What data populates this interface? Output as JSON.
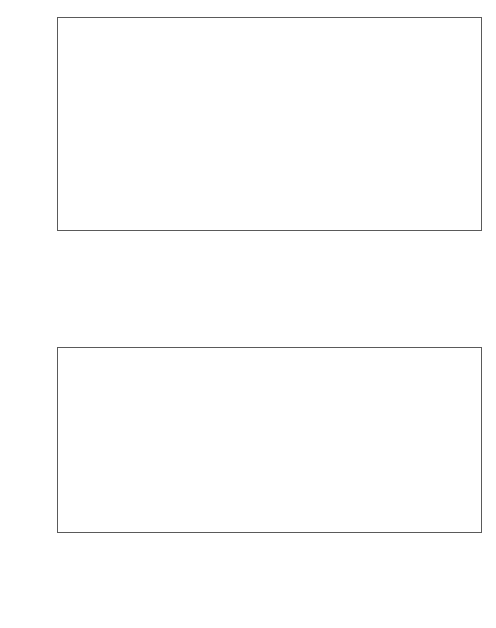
{
  "figure": {
    "background": "#ffffff",
    "colors": {
      "n2o": "#8f8f8f",
      "ch4": "#d8d8d8",
      "co2": "#4f4f4f",
      "cost20": "#d8d8d8",
      "cost50": "#8f8f8f",
      "cost100": "#4f4f4f",
      "axis": "#5a5a5a"
    }
  },
  "chart_data": [
    {
      "type": "bar",
      "id": "top",
      "stacked": true,
      "title": "",
      "xlabel": "",
      "ylabel": "Mt CO2-eq/yr",
      "ylabel_parts": {
        "pre": "Mt CO",
        "sub": "2",
        "post": "-eq/yr"
      },
      "ylim": [
        -200,
        1800
      ],
      "yticks": [
        -200,
        0,
        200,
        400,
        600,
        800,
        1000,
        1200,
        1400,
        1600,
        1800
      ],
      "grid": false,
      "legend_position": "top-right",
      "legend": [
        {
          "name": "N2O",
          "parts": {
            "pre": "N",
            "sub": "2",
            "post": "O"
          },
          "color": "#8f8f8f"
        },
        {
          "name": "CH4",
          "parts": {
            "pre": "CH",
            "sub": "4",
            "post": ""
          },
          "color": "#d8d8d8"
        },
        {
          "name": "CO2",
          "parts": {
            "pre": "CO",
            "sub": "2",
            "post": ""
          },
          "color": "#4f4f4f"
        }
      ],
      "categories": [
        {
          "lines": [
            "cropland management"
          ]
        },
        {
          "lines": [
            "grazing land management"
          ]
        },
        {
          "lines": [
            "restore cultivated",
            "organic soils"
          ]
        },
        {
          "lines": [
            "restore degraded land"
          ]
        },
        {
          "lines": [
            "rice management"
          ]
        },
        {
          "lines": [
            "livestock"
          ]
        },
        {
          "lines": [
            "bioenergy (soils component)"
          ]
        },
        {
          "lines": [
            "water management"
          ]
        },
        {
          "lines": [
            "set-aside, LUC & agroforestry"
          ]
        },
        {
          "lines": [
            "manure management"
          ]
        }
      ],
      "series": [
        {
          "name": "CO2",
          "color": "#4f4f4f",
          "values": [
            1440,
            1465,
            1350,
            660,
            0,
            0,
            220,
            75,
            40,
            0
          ]
        },
        {
          "name": "CH4",
          "color": "#d8d8d8",
          "values": [
            0,
            0,
            -90,
            15,
            255,
            240,
            0,
            0,
            0,
            40
          ]
        },
        {
          "name": "N2O",
          "color": "#8f8f8f",
          "values": [
            115,
            0,
            0,
            10,
            0,
            0,
            0,
            0,
            0,
            0
          ]
        }
      ],
      "totals": [
        1555,
        1465,
        1350,
        685,
        255,
        240,
        220,
        75,
        40,
        40
      ]
    },
    {
      "type": "bar",
      "id": "bottom",
      "stacked": false,
      "title": "",
      "xlabel": "Mitigation measure",
      "ylabel": "Mt CO2-eq/yr",
      "ylabel_parts": {
        "pre": "Mt CO",
        "sub": "2",
        "post": "-eq/yr"
      },
      "ylim": [
        0,
        1400
      ],
      "yticks": [
        0,
        200,
        400,
        600,
        800,
        1000,
        1200,
        1400
      ],
      "grid": false,
      "legend_position": "top-right",
      "legend": [
        {
          "name": "up to 20 US$/tCO2-eq.",
          "parts": {
            "pre": "up to 20 US$/tCO",
            "sub": "2",
            "post": "-eq."
          },
          "color": "#d8d8d8"
        },
        {
          "name": "up to 50 US$/tCO2-eq.",
          "parts": {
            "pre": "up to 50 US$/tCO",
            "sub": "2",
            "post": "-eq."
          },
          "color": "#8f8f8f"
        },
        {
          "name": "up to 100 US$/tCO2-eq",
          "parts": {
            "pre": "up to 100 US$/tCO",
            "sub": "2",
            "post": "-eq"
          },
          "color": "#4f4f4f"
        }
      ],
      "categories": [
        {
          "lines": [
            "restore cultivated",
            "organic soils"
          ]
        },
        {
          "lines": [
            "cropland",
            "management"
          ]
        },
        {
          "lines": [
            "grazing land",
            "management"
          ]
        },
        {
          "lines": [
            "restore",
            "degraded lands"
          ]
        },
        {
          "lines": [
            "rice",
            "management"
          ]
        },
        {
          "lines": [
            "livestock"
          ]
        },
        {
          "lines": [
            "set-aside, LUC&",
            "agroforestry"
          ]
        },
        {
          "lines": [
            "manure",
            "management"
          ]
        }
      ],
      "series": [
        {
          "name": "up to 20 US$/tCO2-eq.",
          "color": "#d8d8d8",
          "values": [
            248,
            770,
            160,
            135,
            170,
            130,
            8,
            10
          ]
        },
        {
          "name": "up to 50 US$/tCO2-eq.",
          "color": "#8f8f8f",
          "values": [
            628,
            875,
            405,
            345,
            182,
            170,
            22,
            22
          ]
        },
        {
          "name": "up to 100 US$/tCO2-eq",
          "color": "#4f4f4f",
          "values": [
            1262,
            855,
            815,
            690,
            210,
            205,
            45,
            42
          ]
        }
      ]
    }
  ]
}
